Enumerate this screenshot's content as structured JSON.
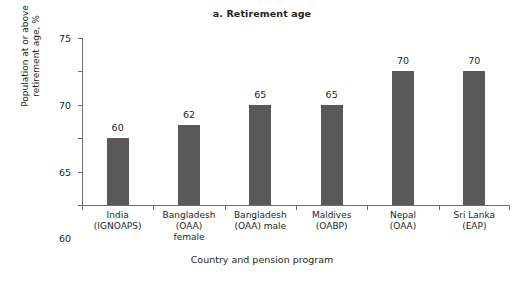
{
  "chart_data": {
    "type": "bar",
    "title": "a. Retirement age",
    "xlabel": "Country and pension program",
    "ylabel": "Population at or above\nretirement age, %",
    "categories": [
      "India\n(IGNOAPS)",
      "Bangladesh\n(OAA)\nfemale",
      "Bangladesh\n(OAA) male",
      "Maldives\n(OABP)",
      "Nepal\n(OAA)",
      "Sri Lanka\n(EAP)"
    ],
    "values": [
      60,
      62,
      65,
      65,
      70,
      70
    ],
    "value_labels": [
      "60",
      "62",
      "65",
      "65",
      "70",
      "70"
    ],
    "ylim": [
      50,
      75
    ],
    "yticks": [
      50,
      55,
      60,
      65,
      70,
      75
    ],
    "ytick_labels": [
      "50",
      "55",
      "60",
      "65",
      "70",
      "75"
    ],
    "grid": false,
    "legend": null,
    "bar_color": "#595959",
    "axis_color": "#6d6e71",
    "text_color": "#231f20",
    "background": "#ffffff"
  }
}
